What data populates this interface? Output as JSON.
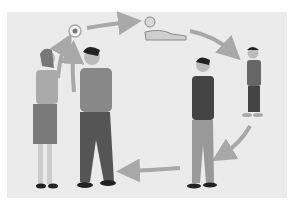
{
  "diagram": {
    "type": "human life cycle",
    "stages": [
      {
        "id": "adults",
        "label": "adult woman and man"
      },
      {
        "id": "zygote",
        "label": "fertilized egg"
      },
      {
        "id": "baby",
        "label": "crawling baby"
      },
      {
        "id": "toddler",
        "label": "toddler"
      },
      {
        "id": "adolescent",
        "label": "adolescent boy"
      }
    ],
    "colors": {
      "background": "#ebebeb",
      "arrow": "#a8a8a8",
      "egg_ring": "#b0b0b0",
      "egg_core": "#777777"
    }
  }
}
